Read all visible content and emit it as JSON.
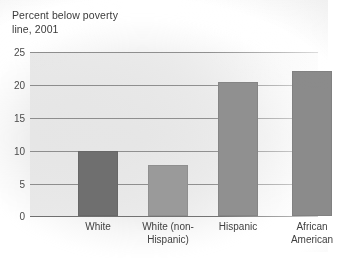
{
  "chart_data": {
    "type": "bar",
    "title": "Percent below poverty\nline, 2001",
    "title_line1": "Percent below poverty",
    "title_line2": "line, 2001",
    "xlabel": "",
    "ylabel": "",
    "ylim": [
      0,
      25
    ],
    "yticks": [
      0,
      5,
      10,
      15,
      20,
      25
    ],
    "ytick_labels": [
      "0",
      "5",
      "10",
      "15",
      "20",
      "25"
    ],
    "grid": true,
    "legend": false,
    "categories": [
      "White",
      "White (non-Hispanic)",
      "Hispanic",
      "African American"
    ],
    "category_labels": [
      "White",
      "White (non-\nHispanic)",
      "Hispanic",
      "African\nAmerican"
    ],
    "values": [
      9.9,
      7.8,
      20.4,
      22.1
    ],
    "bar_colors": [
      "#6f6f6f",
      "#9a9a9a",
      "#909090",
      "#8b8b8b"
    ],
    "bar_width_px": 40,
    "bar_centers_px": [
      68,
      138,
      208,
      282
    ]
  },
  "colors": {
    "plot_background": "#e6e6e6",
    "gridline": "#8d8d8d",
    "axis": "#6f6f6f",
    "text": "#3f3f3f",
    "page_background": "#ffffff"
  }
}
